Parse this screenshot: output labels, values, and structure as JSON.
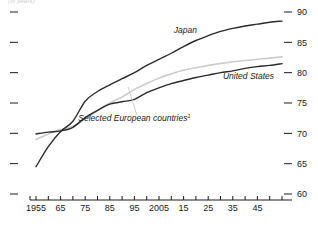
{
  "caption": "(in years)",
  "chart_data": {
    "type": "line",
    "title": "",
    "subtitle": "",
    "xlabel": "",
    "ylabel": "(in years)",
    "ylim": [
      60,
      90
    ],
    "xlim": [
      1955,
      2055
    ],
    "grid": false,
    "legend_position": "inline-annotation",
    "y_axis_side": "right",
    "y_ticks": [
      90,
      85,
      80,
      75,
      70,
      65,
      60
    ],
    "x_ticks": [
      1955,
      1960,
      1965,
      1970,
      1975,
      1980,
      1985,
      1990,
      1995,
      2000,
      2005,
      2010,
      2015,
      2020,
      2025,
      2030,
      2035,
      2040,
      2045,
      2050,
      2055
    ],
    "x_tick_labels": [
      "1955",
      "",
      "65",
      "",
      "75",
      "",
      "85",
      "",
      "95",
      "",
      "2005",
      "",
      "15",
      "",
      "25",
      "",
      "35",
      "",
      "45",
      "",
      ""
    ],
    "x": [
      1955,
      1960,
      1965,
      1970,
      1975,
      1980,
      1985,
      1990,
      1995,
      2000,
      2005,
      2010,
      2015,
      2020,
      2025,
      2030,
      2035,
      2040,
      2045,
      2050,
      2055
    ],
    "series": [
      {
        "name": "Japan",
        "color": "#2b2b2b",
        "values": [
          64.5,
          67.8,
          70.3,
          72.0,
          75.3,
          76.9,
          78.0,
          79.0,
          80.0,
          81.2,
          82.2,
          83.2,
          84.3,
          85.3,
          86.1,
          86.8,
          87.3,
          87.7,
          88.0,
          88.3,
          88.5
        ]
      },
      {
        "name": "United States",
        "color": "#2b2b2b",
        "values": [
          69.9,
          70.2,
          70.4,
          71.0,
          72.6,
          73.8,
          74.8,
          75.2,
          75.6,
          76.7,
          77.5,
          78.2,
          78.7,
          79.2,
          79.6,
          80.0,
          80.3,
          80.7,
          81.0,
          81.2,
          81.5
        ]
      },
      {
        "name": "Selected European countries",
        "color": "#cccccc",
        "values": [
          69.0,
          69.9,
          70.6,
          71.2,
          72.4,
          73.7,
          75.0,
          76.0,
          77.2,
          78.2,
          79.1,
          79.8,
          80.4,
          80.8,
          81.2,
          81.5,
          81.8,
          82.0,
          82.2,
          82.4,
          82.6
        ]
      }
    ],
    "annotations": [
      {
        "text": "Japan",
        "x": 2011,
        "y": 86.5
      },
      {
        "text": "United States",
        "x": 2031,
        "y": 79.0
      },
      {
        "text": "Selected European countries",
        "x": 1995,
        "y": 72.0,
        "footnote": "1"
      }
    ]
  },
  "labels": {
    "japan": "Japan",
    "united_states": "United States",
    "europe": "Selected European countries",
    "europe_footnote": "1"
  }
}
